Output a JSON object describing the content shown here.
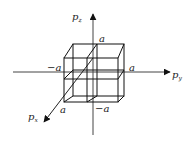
{
  "diagram": {
    "type": "3d-momentum-cube",
    "axes": {
      "z": {
        "label": "p",
        "subscript": "z"
      },
      "y": {
        "label": "p",
        "subscript": "y"
      },
      "x": {
        "label": "p",
        "subscript": "x"
      }
    },
    "tick_labels": {
      "z_pos": "a",
      "y_pos": "a",
      "y_neg": "−a",
      "x_pos": "a",
      "z_neg": "−a"
    },
    "colors": {
      "line": "#111111",
      "background": "#ffffff"
    }
  }
}
